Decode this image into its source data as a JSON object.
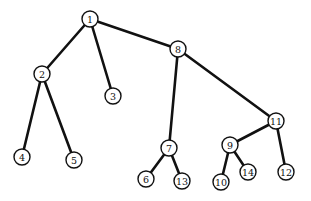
{
  "diagram": {
    "type": "tree",
    "colors": {
      "line": "#111111",
      "node_fill": "#ffffff"
    },
    "node_radius": 8,
    "nodes": [
      {
        "id": "1",
        "label": "1",
        "x": 90,
        "y": 19
      },
      {
        "id": "2",
        "label": "2",
        "x": 42,
        "y": 74
      },
      {
        "id": "3",
        "label": "3",
        "x": 113,
        "y": 96
      },
      {
        "id": "4",
        "label": "4",
        "x": 22,
        "y": 157
      },
      {
        "id": "5",
        "label": "5",
        "x": 74,
        "y": 160
      },
      {
        "id": "6",
        "label": "6",
        "x": 146,
        "y": 179
      },
      {
        "id": "7",
        "label": "7",
        "x": 169,
        "y": 148
      },
      {
        "id": "8",
        "label": "8",
        "x": 178,
        "y": 49
      },
      {
        "id": "9",
        "label": "9",
        "x": 230,
        "y": 145
      },
      {
        "id": "10",
        "label": "10",
        "x": 221,
        "y": 182
      },
      {
        "id": "11",
        "label": "11",
        "x": 276,
        "y": 121
      },
      {
        "id": "12",
        "label": "12",
        "x": 286,
        "y": 172
      },
      {
        "id": "13",
        "label": "13",
        "x": 182,
        "y": 181
      },
      {
        "id": "14",
        "label": "14",
        "x": 248,
        "y": 172
      }
    ],
    "edges": [
      {
        "from": "1",
        "to": "2"
      },
      {
        "from": "1",
        "to": "3"
      },
      {
        "from": "1",
        "to": "8"
      },
      {
        "from": "2",
        "to": "4"
      },
      {
        "from": "2",
        "to": "5"
      },
      {
        "from": "8",
        "to": "7"
      },
      {
        "from": "8",
        "to": "11"
      },
      {
        "from": "7",
        "to": "6"
      },
      {
        "from": "7",
        "to": "13"
      },
      {
        "from": "11",
        "to": "9"
      },
      {
        "from": "11",
        "to": "12"
      },
      {
        "from": "9",
        "to": "10"
      },
      {
        "from": "9",
        "to": "14"
      }
    ]
  }
}
